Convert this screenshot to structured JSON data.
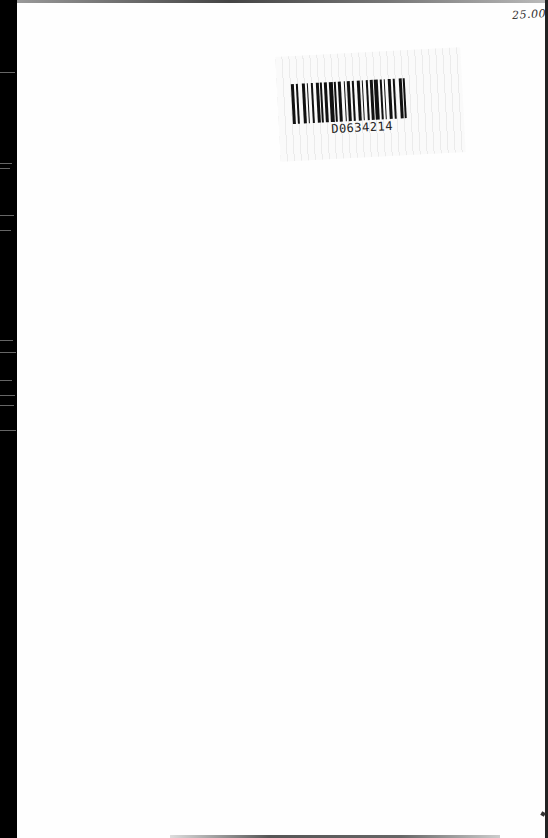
{
  "document": {
    "type": "scanned book flyleaf",
    "handwritten_price": "25.00",
    "barcode": {
      "label": "D0634214"
    }
  }
}
